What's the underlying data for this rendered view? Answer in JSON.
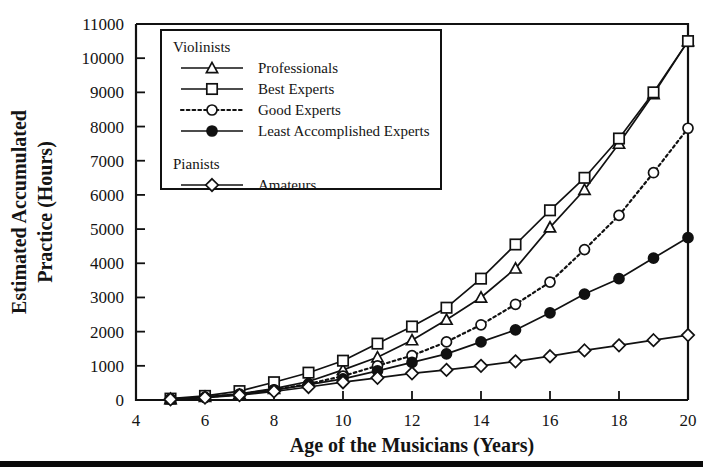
{
  "chart_data": {
    "type": "line",
    "title": "",
    "xlabel": "Age of the Musicians (Years)",
    "ylabel": "Estimated Accumulated Practice (Hours)",
    "ylabel_line1": "Estimated Accumulated",
    "ylabel_line2": "Practice (Hours)",
    "xlim": [
      4,
      20
    ],
    "ylim": [
      0,
      11000
    ],
    "xticks": [
      4,
      6,
      8,
      10,
      12,
      14,
      16,
      18,
      20
    ],
    "yticks": [
      0,
      1000,
      2000,
      3000,
      4000,
      5000,
      6000,
      7000,
      8000,
      9000,
      10000,
      11000
    ],
    "xtick_labels": [
      "4",
      "6",
      "8",
      "10",
      "12",
      "14",
      "16",
      "18",
      "20"
    ],
    "ytick_labels": [
      "0",
      "1000",
      "2000",
      "3000",
      "4000",
      "5000",
      "6000",
      "7000",
      "8000",
      "9000",
      "10000",
      "11000"
    ],
    "x": [
      5,
      6,
      7,
      8,
      9,
      10,
      11,
      12,
      13,
      14,
      15,
      16,
      17,
      18,
      19,
      20
    ],
    "grid": false,
    "legend_position": "upper-left-inside",
    "series": [
      {
        "name": "Professionals",
        "group": "Violinists",
        "marker": "triangle-open",
        "line": "solid",
        "values": [
          30,
          90,
          180,
          330,
          540,
          880,
          1250,
          1750,
          2350,
          3000,
          3850,
          5050,
          6150,
          7500,
          8950,
          10500
        ]
      },
      {
        "name": "Best Experts",
        "group": "Violinists",
        "marker": "square-open",
        "line": "solid",
        "values": [
          40,
          120,
          260,
          520,
          800,
          1150,
          1650,
          2150,
          2700,
          3550,
          4550,
          5550,
          6500,
          7650,
          9000,
          10500
        ]
      },
      {
        "name": "Good Experts",
        "group": "Violinists",
        "marker": "circle-open",
        "line": "dotted",
        "values": [
          25,
          80,
          170,
          300,
          470,
          700,
          1000,
          1300,
          1700,
          2200,
          2800,
          3450,
          4400,
          5400,
          6650,
          7950
        ]
      },
      {
        "name": "Least Accomplished Experts",
        "group": "Violinists",
        "marker": "circle-filled",
        "line": "solid",
        "values": [
          25,
          75,
          160,
          290,
          450,
          620,
          850,
          1100,
          1350,
          1700,
          2050,
          2550,
          3100,
          3550,
          4150,
          4750
        ]
      },
      {
        "name": "Amateurs",
        "group": "Pianists",
        "marker": "diamond-open",
        "line": "solid",
        "values": [
          20,
          70,
          140,
          250,
          380,
          520,
          650,
          780,
          880,
          1000,
          1130,
          1280,
          1450,
          1600,
          1750,
          1900
        ]
      }
    ],
    "legend_groups": [
      {
        "heading": "Violinists",
        "entries": [
          "Professionals",
          "Best Experts",
          "Good Experts",
          "Least Accomplished Experts"
        ]
      },
      {
        "heading": "Pianists",
        "entries": [
          "Amateurs"
        ]
      }
    ]
  }
}
